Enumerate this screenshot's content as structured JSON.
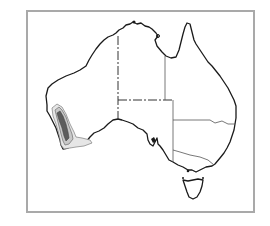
{
  "map": {
    "subject": "Australia outline map",
    "regions": [
      "Western Australia",
      "Northern Territory",
      "South Australia",
      "Queensland",
      "New South Wales",
      "Victoria",
      "Tasmania"
    ],
    "highlight": {
      "description": "Shaded distribution area in south-west Western Australia",
      "levels": [
        "outer",
        "middle",
        "core"
      ],
      "colors": {
        "outer": "#e6e6e6",
        "middle": "#c8c8c8",
        "core": "#5c5c5c"
      }
    },
    "frame_color": "#a9a9a9",
    "coast_color": "#1a1a1a"
  }
}
